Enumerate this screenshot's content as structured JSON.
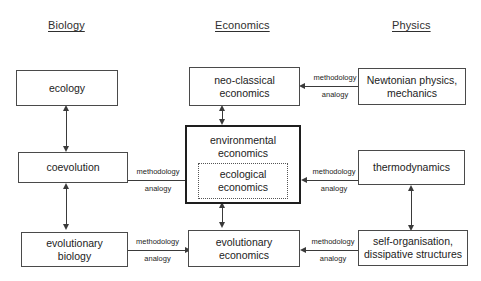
{
  "diagram": {
    "title_headers": [
      {
        "id": "biology",
        "label": "Biology"
      },
      {
        "id": "economics",
        "label": "Economics"
      },
      {
        "id": "physics",
        "label": "Physics"
      }
    ],
    "nodes": [
      {
        "id": "ecology",
        "label": "ecology",
        "column": "biology"
      },
      {
        "id": "coevolution",
        "label": "coevolution",
        "column": "biology"
      },
      {
        "id": "evolutionary-biology",
        "label": "evolutionary\nbiology",
        "column": "biology"
      },
      {
        "id": "neo-classical-economics",
        "label": "neo-classical\neconomics",
        "column": "economics"
      },
      {
        "id": "environmental-economics",
        "label": "environmental\neconomics",
        "column": "economics"
      },
      {
        "id": "ecological-economics",
        "label": "ecological\neconomics",
        "column": "economics"
      },
      {
        "id": "evolutionary-economics",
        "label": "evolutionary\neconomics",
        "column": "economics"
      },
      {
        "id": "newtonian-physics",
        "label": "Newtonian physics,\nmechanics",
        "column": "physics"
      },
      {
        "id": "thermodynamics",
        "label": "thermodynamics",
        "column": "physics"
      },
      {
        "id": "self-organisation",
        "label": "self-organisation,\ndissipative structures",
        "column": "physics"
      }
    ],
    "edge_labels": [
      {
        "id": "neo-classical-from-newtonian",
        "top": "methodology",
        "bottom": "analogy"
      },
      {
        "id": "ecological-from-coevolution",
        "top": "methodology",
        "bottom": "analogy"
      },
      {
        "id": "ecological-from-thermodynamics",
        "top": "methodology",
        "bottom": "analogy"
      },
      {
        "id": "evolutionary-economics-from-biology",
        "top": "methodology",
        "bottom": "analogy"
      },
      {
        "id": "evolutionary-economics-from-self-organisation",
        "top": "methodology",
        "bottom": "analogy"
      }
    ],
    "colors": {
      "background": "#ffffff",
      "box_border": "#4a4a4a",
      "emphasis_border": "#1e1e1e",
      "dotted_border": "#555555",
      "arrow": "#3a3a3a",
      "text": "#222222"
    }
  }
}
